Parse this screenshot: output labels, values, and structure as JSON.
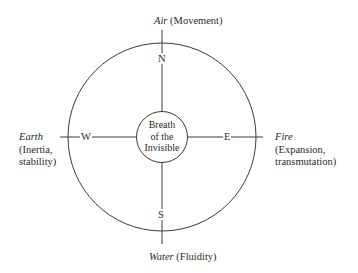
{
  "diagram": {
    "center": {
      "lines": [
        "Breath",
        "of the",
        "Invisible"
      ]
    },
    "directions": {
      "north": "N",
      "south": "S",
      "east": "E",
      "west": "W"
    },
    "elements": {
      "north": {
        "name": "Air",
        "quality": "(Movement)"
      },
      "south": {
        "name": "Water",
        "quality": "(Fluidity)"
      },
      "west": {
        "name": "Earth",
        "quality_line1": "(Inertia,",
        "quality_line2": "stability)"
      },
      "east": {
        "name": "Fire",
        "quality_line1": "(Expansion,",
        "quality_line2": "transmutation)"
      }
    },
    "colors": {
      "stroke": "#3a3a3a",
      "background": "#ffffff"
    }
  }
}
